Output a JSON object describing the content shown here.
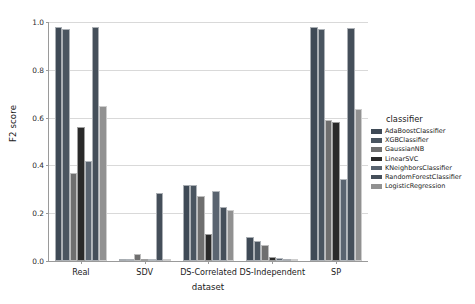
{
  "chart_data": {
    "type": "bar",
    "title": "",
    "xlabel": "dataset",
    "ylabel": "F2 score",
    "ylim": [
      0.0,
      1.0
    ],
    "yticks": [
      "0.0",
      "0.2",
      "0.4",
      "0.6",
      "0.8",
      "1.0"
    ],
    "ytick_values": [
      0.0,
      0.2,
      0.4,
      0.6,
      0.8,
      1.0
    ],
    "grid": true,
    "legend_position": "right",
    "legend_title": "classifier",
    "categories": [
      "Real",
      "SDV",
      "DS-Correlated",
      "DS-Independent",
      "SP"
    ],
    "series": [
      {
        "name": "AdaBoostClassifier",
        "color": "#3f4a56",
        "values": [
          0.98,
          0.0,
          0.32,
          0.1,
          0.98
        ]
      },
      {
        "name": "XGBClassifier",
        "color": "#4a5560",
        "values": [
          0.97,
          0.0,
          0.32,
          0.085,
          0.97
        ]
      },
      {
        "name": "GaussianNB",
        "color": "#6f6f6f",
        "values": [
          0.37,
          0.03,
          0.27,
          0.065,
          0.59
        ]
      },
      {
        "name": "LinearSVC",
        "color": "#2a2a2a",
        "values": [
          0.56,
          0.0,
          0.115,
          0.015,
          0.58
        ]
      },
      {
        "name": "KNeighborsClassifier",
        "color": "#5a6470",
        "values": [
          0.42,
          0.0,
          0.295,
          0.012,
          0.345
        ]
      },
      {
        "name": "RandomForestClassifier",
        "color": "#454f5a",
        "values": [
          0.98,
          0.285,
          0.225,
          0.0,
          0.975
        ]
      },
      {
        "name": "LogisticRegression",
        "color": "#919191",
        "values": [
          0.65,
          0.0,
          0.215,
          0.0,
          0.635
        ]
      }
    ]
  }
}
